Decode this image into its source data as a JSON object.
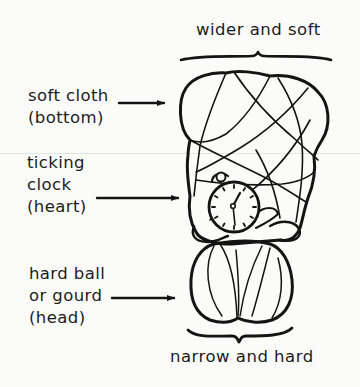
{
  "figure": {
    "top_caption": "wider and soft",
    "bottom_caption": "narrow and hard",
    "labels": [
      {
        "id": "bottom",
        "lines": [
          "soft cloth",
          "(bottom)"
        ],
        "points_to": "soft cloth bundle"
      },
      {
        "id": "heart",
        "lines": [
          "ticking",
          "clock",
          "(heart)"
        ],
        "points_to": "clock"
      },
      {
        "id": "head",
        "lines": [
          "hard ball",
          "or gourd",
          "(head)"
        ],
        "points_to": "gourd"
      }
    ],
    "icons": {
      "arrow": "arrow-right-icon",
      "brace_top": "curly-brace-icon",
      "brace_bottom": "curly-brace-icon",
      "clock": "clock-icon"
    },
    "colors": {
      "ink": "#141414",
      "paper": "#fbfbfa"
    }
  }
}
